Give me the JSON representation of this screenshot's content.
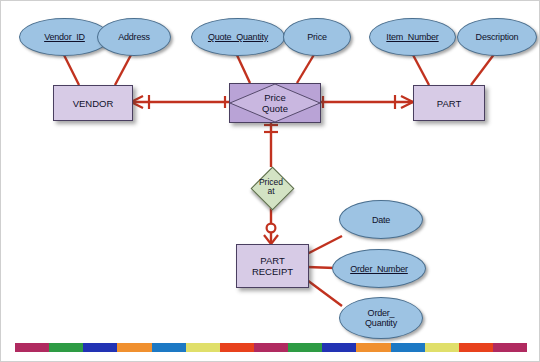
{
  "diagram": {
    "notation": "crow's foot",
    "colors": {
      "attribute_fill": "#9dc3e3",
      "attribute_stroke": "#4a6f8f",
      "entity_fill": "#d7cbe6",
      "entity_stroke": "#4a3f60",
      "associative_fill": "#b9a3d6",
      "relationship_fill": "#d3e3c4",
      "relationship_stroke": "#5a6a4a",
      "connector": "#c1321f"
    }
  },
  "entities": [
    {
      "id": "vendor",
      "label": "VENDOR"
    },
    {
      "id": "part",
      "label": "PART"
    },
    {
      "id": "part_receipt",
      "label": "PART\nRECEIPT"
    }
  ],
  "associative_entities": [
    {
      "id": "price_quote",
      "label": "Price\nQuote"
    }
  ],
  "relationships": [
    {
      "id": "priced_at",
      "label": "Priced\nat"
    }
  ],
  "attributes": [
    {
      "id": "vendor_id",
      "label": "Vendor_ID",
      "owner": "vendor",
      "primary_key": true
    },
    {
      "id": "address",
      "label": "Address",
      "owner": "vendor",
      "primary_key": false
    },
    {
      "id": "quote_quantity",
      "label": "Quote_Quantity",
      "owner": "price_quote",
      "primary_key": true
    },
    {
      "id": "price",
      "label": "Price",
      "owner": "price_quote",
      "primary_key": false
    },
    {
      "id": "item_number",
      "label": "Item_Number",
      "owner": "part",
      "primary_key": true
    },
    {
      "id": "description",
      "label": "Description",
      "owner": "part",
      "primary_key": false
    },
    {
      "id": "date",
      "label": "Date",
      "owner": "part_receipt",
      "primary_key": false
    },
    {
      "id": "order_number",
      "label": "Order_Number",
      "owner": "part_receipt",
      "primary_key": true
    },
    {
      "id": "order_quantity",
      "label": "Order_\nQuantity",
      "owner": "part_receipt",
      "primary_key": false
    }
  ],
  "connections": [
    {
      "id": "vendor-price_quote",
      "from": "vendor",
      "to": "price_quote",
      "from_cardinality": "many-mandatory",
      "to_cardinality": "one-mandatory"
    },
    {
      "id": "price_quote-part",
      "from": "price_quote",
      "to": "part",
      "from_cardinality": "one-mandatory",
      "to_cardinality": "many-mandatory"
    },
    {
      "id": "price_quote-priced_at",
      "from": "price_quote",
      "to": "priced_at",
      "from_cardinality": "one-mandatory",
      "to_cardinality": "none"
    },
    {
      "id": "priced_at-part_receipt",
      "from": "priced_at",
      "to": "part_receipt",
      "from_cardinality": "none",
      "to_cardinality": "many-optional"
    }
  ],
  "colorbar": {
    "segments": [
      "#b02a60",
      "#2e9b44",
      "#2233b4",
      "#f0902f",
      "#1d79c4",
      "#e0df6a",
      "#e8411c",
      "#b02a60",
      "#2e9b44",
      "#2233b4",
      "#f0902f",
      "#1d79c4",
      "#e0df6a",
      "#e8411c",
      "#b02a60"
    ]
  }
}
